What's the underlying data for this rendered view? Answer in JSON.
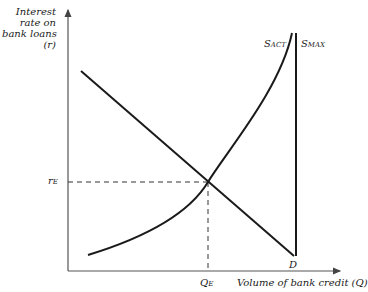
{
  "diagram": {
    "y_axis_label": [
      "Interest",
      "rate on",
      "bank loans",
      "(r)"
    ],
    "x_axis_label": "Volume of bank credit (Q)",
    "equilibrium_rate_label": {
      "main": "r",
      "sub": "E"
    },
    "equilibrium_quantity_label": {
      "main": "Q",
      "sub": "E"
    },
    "demand_label": "D",
    "supply_actual_label": {
      "main": "S",
      "sub": "ACT"
    },
    "supply_max_label": {
      "main": "S",
      "sub": "MAX"
    },
    "line_color": "#1a1a1a",
    "axis_color": "#555555"
  }
}
